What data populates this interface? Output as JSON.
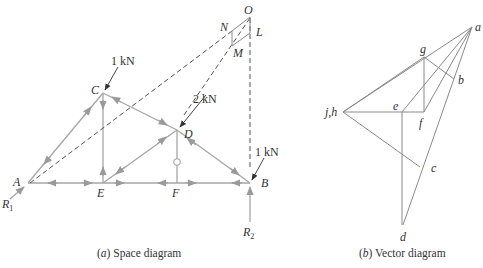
{
  "space_diagram": {
    "caption_prefix": "(",
    "caption_letter": "a",
    "caption_text": ") Space diagram",
    "joints": {
      "A": "A",
      "B": "B",
      "C": "C",
      "D": "D",
      "E": "E",
      "F": "F"
    },
    "construction_points": {
      "O": "O",
      "N": "N",
      "M": "M",
      "L": "L"
    },
    "loads": [
      {
        "at": "C",
        "label": "1 kN"
      },
      {
        "at": "D",
        "label": "2 kN"
      },
      {
        "at": "B",
        "label": "1 kN"
      }
    ],
    "reactions": [
      {
        "at": "A",
        "label": "R",
        "sub": "1"
      },
      {
        "at": "B",
        "label": "R",
        "sub": "2"
      }
    ]
  },
  "vector_diagram": {
    "caption_prefix": "(",
    "caption_letter": "b",
    "caption_text": ") Vector diagram",
    "points": {
      "a": "a",
      "b": "b",
      "c": "c",
      "d": "d",
      "e": "e",
      "f": "f",
      "g": "g",
      "jh": "j,h"
    }
  },
  "colors": {
    "member": "#a6a6a6",
    "arrow": "#9a9a9a",
    "dashed": "#555555",
    "vector_line": "#8a8a8a",
    "text": "#333333"
  }
}
